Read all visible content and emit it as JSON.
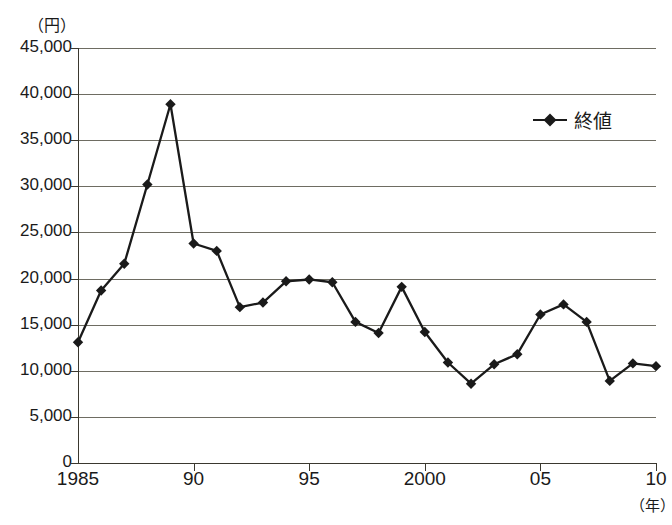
{
  "chart": {
    "title": "",
    "y_unit": "（円）",
    "x_unit": "（年）",
    "legend_label": "終値",
    "legend_marker": "diamond-marker-icon",
    "line_color": "#1a1a1a",
    "grid_color": "#6e6c62",
    "axis_color": "#3a382f"
  },
  "chart_data": {
    "type": "line",
    "title": "",
    "xlabel": "（年）",
    "ylabel": "（円）",
    "ylim": [
      0,
      45000
    ],
    "xlim": [
      1985,
      2010
    ],
    "grid": true,
    "legend_position": "top-right",
    "y_ticks": [
      "0",
      "5,000",
      "10,000",
      "15,000",
      "20,000",
      "25,000",
      "30,000",
      "35,000",
      "40,000",
      "45,000"
    ],
    "y_tick_values": [
      0,
      5000,
      10000,
      15000,
      20000,
      25000,
      30000,
      35000,
      40000,
      45000
    ],
    "x_tick_labels": [
      "1985",
      "90",
      "95",
      "2000",
      "05",
      "10"
    ],
    "x_tick_values": [
      1985,
      1990,
      1995,
      2000,
      2005,
      2010
    ],
    "x": [
      1985,
      1986,
      1987,
      1988,
      1989,
      1990,
      1991,
      1992,
      1993,
      1994,
      1995,
      1996,
      1997,
      1998,
      1999,
      2000,
      2001,
      2002,
      2003,
      2004,
      2005,
      2006,
      2007,
      2008,
      2009,
      2010
    ],
    "series": [
      {
        "name": "終値",
        "marker": "diamond",
        "values": [
          13100,
          18700,
          21600,
          30200,
          38900,
          23800,
          23000,
          16900,
          17400,
          19700,
          19900,
          19600,
          15300,
          14100,
          19100,
          14200,
          10900,
          8600,
          10700,
          11800,
          16100,
          17200,
          15300,
          8900,
          10800,
          10500
        ]
      }
    ]
  }
}
